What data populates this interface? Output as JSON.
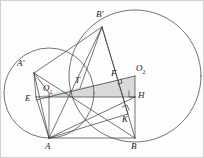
{
  "figure": {
    "type": "geometry-diagram",
    "background": "#fdfdfd",
    "stroke_color": "#3a3a3a",
    "shade_color": "#d9d9d9",
    "border_color": "#cfcfcf"
  },
  "labels": {
    "A_prime": "A'",
    "B_prime": "B'",
    "O1": "O",
    "O1_sub": "1",
    "O2": "O",
    "O2_sub": "2",
    "E": "E",
    "T": "T",
    "F": "F",
    "H": "H",
    "K": "K",
    "A": "A",
    "B": "B"
  },
  "points": {
    "A_prime": {
      "x": 33,
      "y": 72
    },
    "B_prime": {
      "x": 101,
      "y": 26
    },
    "O1": {
      "x": 48,
      "y": 92
    },
    "O2": {
      "x": 134,
      "y": 75
    },
    "E": {
      "x": 35,
      "y": 96
    },
    "T": {
      "x": 79,
      "y": 87
    },
    "F": {
      "x": 116,
      "y": 80
    },
    "H": {
      "x": 134,
      "y": 96
    },
    "K": {
      "x": 127,
      "y": 113
    },
    "A": {
      "x": 48,
      "y": 137
    },
    "B": {
      "x": 134,
      "y": 137
    }
  },
  "circles": [
    {
      "name": "circle-O1",
      "cx": 48,
      "cy": 92,
      "r": 45
    },
    {
      "name": "circle-O2",
      "cx": 134,
      "cy": 75,
      "r": 66
    }
  ],
  "shaded_region": {
    "name": "quadrilateral-TFO2H-E",
    "vertices": "T,F,O2,H,E"
  },
  "right_angles": [
    {
      "at": "F"
    },
    {
      "at": "H"
    },
    {
      "at": "K"
    }
  ],
  "segments": [
    "A'-B'",
    "A'-E",
    "A'-O1",
    "A'-A",
    "A'-B",
    "B'-T",
    "B'-A",
    "B'-B",
    "B'-K",
    "E-H",
    "E-A",
    "T-O2",
    "O1-O2",
    "O1-A",
    "O2-B",
    "O2-H",
    "A-B",
    "A-K",
    "A-H"
  ]
}
